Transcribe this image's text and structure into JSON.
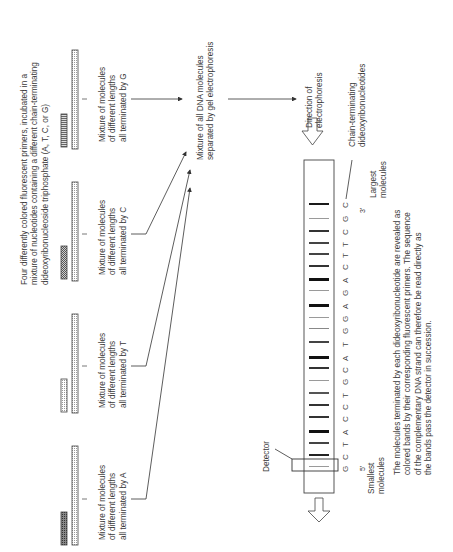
{
  "intro_text": [
    "Four differently colored fluorescent primers, incubated in a",
    "mixture of nucleotides containing a different chain-terminating",
    "dideoxyribonucleoside triphosphate (A, T, C, or G)"
  ],
  "reactions": [
    {
      "terminator": "A",
      "lines": [
        "Mixture of molecules",
        "of different lengths",
        "all terminated by A"
      ]
    },
    {
      "terminator": "T",
      "lines": [
        "Mixture of molecules",
        "of different lengths",
        "all terminated by T"
      ]
    },
    {
      "terminator": "C",
      "lines": [
        "Mixture of molecules",
        "of different lengths",
        "all terminated by C"
      ]
    },
    {
      "terminator": "G",
      "lines": [
        "Mixture of molecules",
        "of different lengths",
        "all terminated by G"
      ]
    }
  ],
  "mixture_label": [
    "Mixture of all DNA molecules",
    "separated by gel electrophoresis"
  ],
  "direction_label": [
    "Direction of",
    "electrophoresis"
  ],
  "chain_terminating_label": [
    "Chain-terminating",
    "dideoxyribonucleotides"
  ],
  "largest_label": [
    "Largest",
    "molecules"
  ],
  "smallest_label": [
    "Smallest",
    "molecules"
  ],
  "detector_label": "Detector",
  "end_3": "3'",
  "end_5": "5'",
  "sequence": [
    "G",
    "C",
    "T",
    "A",
    "C",
    "C",
    "T",
    "G",
    "C",
    "A",
    "T",
    "G",
    "G",
    "A",
    "G",
    "A",
    "C",
    "T",
    "T",
    "C",
    "G",
    "C"
  ],
  "caption": [
    "The molecules terminated by each dideoxyribonucleotide are revealed as",
    "colored bands by their corresponding fluorescent primers.  The sequence",
    "of the complementary DNA strand can therefore be read directly as",
    "the bands pass the detector in succession."
  ],
  "colors": {
    "line": "#333333",
    "band_dark": "#1a1a1a",
    "band_mid": "#4a4a4a",
    "band_light": "#9a9a9a"
  }
}
